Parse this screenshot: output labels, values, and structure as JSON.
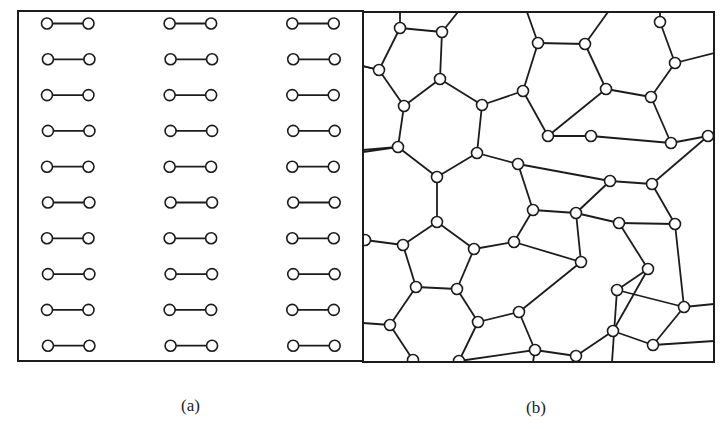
{
  "figure": {
    "panels": [
      {
        "id": "a",
        "caption": "(a)",
        "description": "Crystalline network: regular hexagonal lattice",
        "frame": {
          "x": 18,
          "y": 11,
          "w": 345,
          "h": 350
        }
      },
      {
        "id": "b",
        "caption": "(b)",
        "description": "Amorphous (continuous random) network: rings of 5, 6, 7 and 8 members",
        "frame": {
          "x": 363,
          "y": 12,
          "w": 351,
          "h": 350
        }
      }
    ],
    "colors": {
      "line": "#1c1c1c",
      "node_fill": "#ffffff",
      "background": "#ffffff"
    },
    "node_radius": 5.5,
    "panel_b_nodes": [
      [
        400,
        28
      ],
      [
        442,
        32
      ],
      [
        379,
        70
      ],
      [
        440,
        79
      ],
      [
        404,
        106
      ],
      [
        482,
        105
      ],
      [
        523,
        91
      ],
      [
        538,
        43
      ],
      [
        585,
        44
      ],
      [
        606,
        89
      ],
      [
        651,
        97
      ],
      [
        660,
        22
      ],
      [
        675,
        63
      ],
      [
        548,
        136
      ],
      [
        591,
        136
      ],
      [
        671,
        143
      ],
      [
        708,
        136
      ],
      [
        398,
        147
      ],
      [
        477,
        153
      ],
      [
        437,
        177
      ],
      [
        518,
        164
      ],
      [
        610,
        181
      ],
      [
        652,
        184
      ],
      [
        437,
        222
      ],
      [
        403,
        245
      ],
      [
        474,
        249
      ],
      [
        514,
        242
      ],
      [
        533,
        210
      ],
      [
        576,
        213
      ],
      [
        581,
        262
      ],
      [
        619,
        223
      ],
      [
        648,
        269
      ],
      [
        675,
        224
      ],
      [
        617,
        290
      ],
      [
        684,
        307
      ],
      [
        416,
        287
      ],
      [
        457,
        289
      ],
      [
        478,
        322
      ],
      [
        519,
        312
      ],
      [
        390,
        325
      ],
      [
        413,
        360
      ],
      [
        459,
        361
      ],
      [
        535,
        350
      ],
      [
        576,
        356
      ],
      [
        613,
        331
      ],
      [
        653,
        345
      ],
      [
        365,
        240
      ]
    ],
    "panel_b_edges": [
      [
        0,
        1
      ],
      [
        0,
        2
      ],
      [
        1,
        3
      ],
      [
        2,
        4
      ],
      [
        3,
        4
      ],
      [
        3,
        5
      ],
      [
        5,
        6
      ],
      [
        6,
        7
      ],
      [
        7,
        8
      ],
      [
        8,
        9
      ],
      [
        9,
        10
      ],
      [
        10,
        12
      ],
      [
        12,
        11
      ],
      [
        10,
        15
      ],
      [
        15,
        16
      ],
      [
        9,
        13
      ],
      [
        6,
        13
      ],
      [
        13,
        14
      ],
      [
        14,
        15
      ],
      [
        4,
        17
      ],
      [
        17,
        19
      ],
      [
        19,
        18
      ],
      [
        18,
        5
      ],
      [
        18,
        20
      ],
      [
        20,
        21
      ],
      [
        21,
        22
      ],
      [
        22,
        16
      ],
      [
        20,
        27
      ],
      [
        27,
        28
      ],
      [
        28,
        21
      ],
      [
        19,
        23
      ],
      [
        23,
        24
      ],
      [
        23,
        25
      ],
      [
        25,
        26
      ],
      [
        26,
        27
      ],
      [
        26,
        29
      ],
      [
        29,
        28
      ],
      [
        28,
        30
      ],
      [
        30,
        31
      ],
      [
        30,
        32
      ],
      [
        32,
        22
      ],
      [
        31,
        33
      ],
      [
        33,
        34
      ],
      [
        34,
        32
      ],
      [
        24,
        35
      ],
      [
        35,
        36
      ],
      [
        36,
        25
      ],
      [
        36,
        37
      ],
      [
        37,
        38
      ],
      [
        38,
        29
      ],
      [
        35,
        39
      ],
      [
        39,
        40
      ],
      [
        37,
        41
      ],
      [
        41,
        42
      ],
      [
        42,
        43
      ],
      [
        43,
        44
      ],
      [
        44,
        31
      ],
      [
        44,
        45
      ],
      [
        45,
        34
      ],
      [
        24,
        46
      ],
      [
        38,
        42
      ],
      [
        17,
        47
      ],
      [
        2,
        48
      ]
    ],
    "panel_b_boundary_edges": [
      [
        0,
        400,
        12
      ],
      [
        1,
        458,
        12
      ],
      [
        7,
        527,
        12
      ],
      [
        8,
        608,
        12
      ],
      [
        11,
        660,
        12
      ],
      [
        12,
        714,
        53
      ],
      [
        16,
        714,
        133
      ],
      [
        2,
        363,
        66
      ],
      [
        17,
        363,
        152
      ],
      [
        46,
        363,
        240
      ],
      [
        39,
        363,
        323
      ],
      [
        40,
        413,
        362
      ],
      [
        41,
        459,
        362
      ],
      [
        42,
        533,
        362
      ],
      [
        43,
        574,
        362
      ],
      [
        45,
        714,
        341
      ],
      [
        34,
        714,
        304
      ],
      [
        33,
        612,
        362
      ],
      [
        47,
        363,
        150
      ],
      [
        48,
        363,
        66
      ]
    ]
  }
}
